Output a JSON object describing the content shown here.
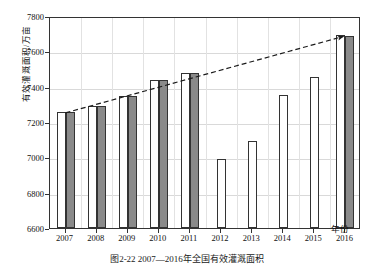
{
  "figure": {
    "caption": "图2-22  2007—2016年全国有效灌溉面积",
    "ylabel": "有效灌溉面积/万亩",
    "xlabel": "年份"
  },
  "chart_data": {
    "type": "bar",
    "title": "图2-22  2007—2016年全国有效灌溉面积",
    "xlabel": "年份",
    "ylabel": "有效灌溉面积/万亩",
    "ylim": [
      6600,
      7800
    ],
    "yticks": [
      6600,
      6800,
      7000,
      7200,
      7400,
      7600,
      7800
    ],
    "grid": true,
    "legend": "none",
    "categories": [
      "2007",
      "2008",
      "2009",
      "2010",
      "2011",
      "2012",
      "2013",
      "2014",
      "2015",
      "2016"
    ],
    "series": [
      {
        "name": "实际值",
        "style": "white-bar",
        "color": "#ffffff",
        "values": [
          7255,
          7288,
          7350,
          7435,
          7480,
          6990,
          7090,
          7355,
          7455,
          7690
        ]
      },
      {
        "name": "规划值",
        "style": "gray-bar",
        "color": "#8a8a8a",
        "values": [
          7255,
          7288,
          7348,
          7435,
          7478,
          null,
          null,
          null,
          null,
          7688
        ]
      }
    ],
    "annotations": [
      {
        "type": "trend-line",
        "style": "dashed-with-arrow",
        "color": "#1a1a1a",
        "from": {
          "x": "2007",
          "y": 7258
        },
        "to": {
          "x": "2016",
          "y": 7695
        }
      }
    ]
  },
  "yticks": [
    {
      "label": "7800",
      "value": 7800
    },
    {
      "label": "7600",
      "value": 7600
    },
    {
      "label": "7400",
      "value": 7400
    },
    {
      "label": "7200",
      "value": 7200
    },
    {
      "label": "7000",
      "value": 7000
    },
    {
      "label": "6800",
      "value": 6800
    },
    {
      "label": "6600",
      "value": 6600
    }
  ],
  "xticks": [
    {
      "label": "2007"
    },
    {
      "label": "2008"
    },
    {
      "label": "2009"
    },
    {
      "label": "2010"
    },
    {
      "label": "2011"
    },
    {
      "label": "2012"
    },
    {
      "label": "2013"
    },
    {
      "label": "2014"
    },
    {
      "label": "2015"
    },
    {
      "label": "2016"
    }
  ]
}
